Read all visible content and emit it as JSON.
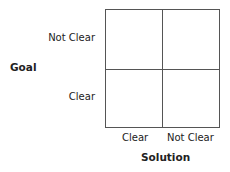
{
  "diagram": {
    "y_axis": {
      "label": "Goal",
      "ticks": [
        "Not Clear",
        "Clear"
      ]
    },
    "x_axis": {
      "label": "Solution",
      "ticks": [
        "Clear",
        "Not Clear"
      ]
    },
    "quadrants": [
      "",
      "",
      "",
      ""
    ]
  }
}
